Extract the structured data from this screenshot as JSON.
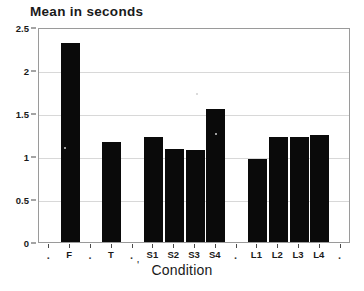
{
  "chart_data": {
    "type": "bar",
    "title": "Mean in seconds",
    "xlabel": "Condition",
    "ylabel": "",
    "categories": [
      ".",
      "F",
      ".",
      "T",
      ".",
      "S1",
      "S2",
      "S3",
      "S4",
      ".",
      "L1",
      "L2",
      "L3",
      "L4",
      "."
    ],
    "values": [
      null,
      2.31,
      null,
      1.16,
      null,
      1.22,
      1.08,
      1.07,
      1.55,
      null,
      0.96,
      1.22,
      1.22,
      1.24,
      null
    ],
    "bars": [
      {
        "label": "F",
        "value": 2.31
      },
      {
        "label": "T",
        "value": 1.16
      },
      {
        "label": "S1",
        "value": 1.22
      },
      {
        "label": "S2",
        "value": 1.08
      },
      {
        "label": "S3",
        "value": 1.07
      },
      {
        "label": "S4",
        "value": 1.55
      },
      {
        "label": "L1",
        "value": 0.96
      },
      {
        "label": "L2",
        "value": 1.22
      },
      {
        "label": "L3",
        "value": 1.22
      },
      {
        "label": "L4",
        "value": 1.24
      }
    ],
    "ylim": [
      0,
      2.5
    ],
    "yticks": [
      0,
      0.5,
      1,
      1.5,
      2,
      2.5
    ],
    "ytick_labels": [
      "0",
      "0.5",
      "1",
      "1.5",
      "2",
      "2.5"
    ],
    "grid": true,
    "legend": "none",
    "bar_color": "#0a0a0a"
  },
  "axis": {
    "x_title": "Condition",
    "x_title_artifact": "'",
    "y_ticks": [
      "2.5",
      "2",
      "1.5",
      "1",
      "0.5",
      "0"
    ],
    "x_ticks": [
      ".",
      "F",
      ".",
      "T",
      ".",
      "S1",
      "S2",
      "S3",
      "S4",
      ".",
      "L1",
      "L2",
      "L3",
      "L4",
      "."
    ]
  }
}
